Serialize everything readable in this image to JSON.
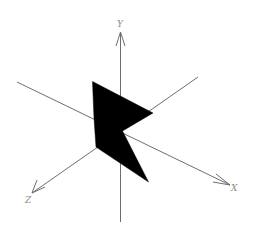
{
  "diagram": {
    "type": "3d-axes-with-polygon",
    "colors": {
      "background": "#ffffff",
      "axis": "#6e6e6e",
      "label": "#8a8a8a",
      "shape": "#000000"
    },
    "axes": [
      {
        "name": "Y",
        "label": "Y",
        "from": [
          120.5,
          222
        ],
        "to": [
          120.5,
          32
        ],
        "label_pos": [
          117,
          24
        ]
      },
      {
        "name": "X",
        "label": "X",
        "from": [
          17,
          82
        ],
        "to": [
          230,
          185
        ],
        "label_pos": [
          231,
          191
        ]
      },
      {
        "name": "Z",
        "label": "Z",
        "from": [
          198,
          77
        ],
        "to": [
          32,
          193
        ],
        "label_pos": [
          25,
          203
        ]
      }
    ],
    "shape": {
      "name": "arrow-like black polygon",
      "points": [
        [
          92.5,
          81.5
        ],
        [
          153,
          113
        ],
        [
          122.5,
          131
        ],
        [
          148.5,
          182
        ],
        [
          96,
          147
        ],
        [
          94,
          118
        ]
      ]
    }
  }
}
